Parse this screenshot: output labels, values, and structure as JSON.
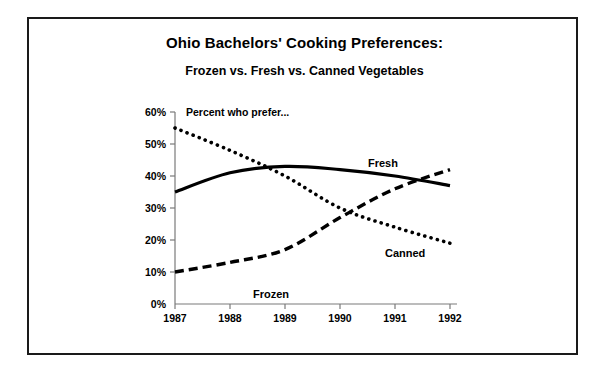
{
  "figure": {
    "title_main": "Ohio Bachelors' Cooking Preferences:",
    "title_sub": "Frozen vs. Fresh vs. Canned Vegetables",
    "annotation": "Percent who prefer...",
    "border_color": "#1a1a1a",
    "background": "#ffffff",
    "ink_color": "#000000"
  },
  "chart_data": {
    "type": "line",
    "title": "Ohio Bachelors' Cooking Preferences: Frozen vs. Fresh vs. Canned Vegetables",
    "subtitle": "Frozen vs. Fresh vs. Canned Vegetables",
    "annotation": "Percent who prefer...",
    "xlabel": "",
    "ylabel": "",
    "x": [
      1987,
      1988,
      1989,
      1990,
      1991,
      1992
    ],
    "categories": [
      "1987",
      "1988",
      "1989",
      "1990",
      "1991",
      "1992"
    ],
    "xtick_labels": [
      "1987",
      "1988",
      "1989",
      "1990",
      "1991",
      "1992"
    ],
    "ytick_labels": [
      "0%",
      "10%",
      "20%",
      "30%",
      "40%",
      "50%",
      "60%"
    ],
    "ytick_values": [
      0,
      10,
      20,
      30,
      40,
      50,
      60
    ],
    "ylim": [
      0,
      60
    ],
    "xlim": [
      1987,
      1992
    ],
    "grid": false,
    "legend_position": "inline-labels",
    "series": [
      {
        "name": "Canned",
        "style": "dotted",
        "color": "#000000",
        "values": [
          55,
          48,
          40,
          30,
          24,
          19
        ],
        "label_text": "Canned"
      },
      {
        "name": "Fresh",
        "style": "solid",
        "color": "#000000",
        "values": [
          35,
          41,
          43,
          42,
          40,
          37
        ],
        "label_text": "Fresh"
      },
      {
        "name": "Frozen",
        "style": "dashed",
        "color": "#000000",
        "values": [
          10,
          13,
          17,
          27,
          36,
          42
        ],
        "label_text": "Frozen"
      }
    ]
  },
  "axis": {
    "y_labels": [
      "60%",
      "50%",
      "40%",
      "30%",
      "20%",
      "10%",
      "0%"
    ],
    "x_labels": [
      "1987",
      "1988",
      "1989",
      "1990",
      "1991",
      "1992"
    ]
  },
  "labels": {
    "fresh": "Fresh",
    "canned": "Canned",
    "frozen": "Frozen"
  }
}
